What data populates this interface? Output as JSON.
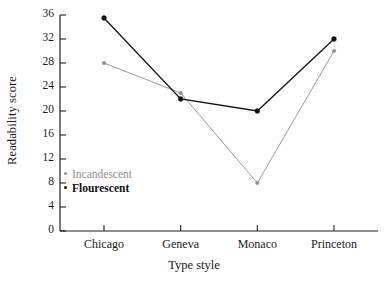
{
  "chart_data": {
    "type": "line",
    "title": "",
    "xlabel": "Type style",
    "ylabel": "Readability score",
    "categories": [
      "Chicago",
      "Geneva",
      "Monaco",
      "Princeton"
    ],
    "ylim": [
      0,
      36
    ],
    "yticks": [
      0,
      4,
      8,
      12,
      16,
      20,
      24,
      28,
      32,
      36
    ],
    "ytick_labels": [
      "0",
      "4",
      "8",
      "12",
      "16",
      "20",
      "24",
      "28",
      "32",
      "36"
    ],
    "grid": false,
    "legend_position": "inside-left",
    "series": [
      {
        "name": "Incandescent",
        "color": "#8f8f8f",
        "values": [
          28,
          23,
          8,
          30
        ]
      },
      {
        "name": "Flourescent",
        "color": "#111111",
        "values": [
          35.5,
          22,
          20,
          32
        ]
      }
    ]
  },
  "axes": {
    "y_title": "Readability score",
    "x_title": "Type style"
  },
  "legend": {
    "items": [
      {
        "label": "Incandescent",
        "color": "#8f8f8f"
      },
      {
        "label": "Flourescent",
        "color": "#111111"
      }
    ]
  }
}
